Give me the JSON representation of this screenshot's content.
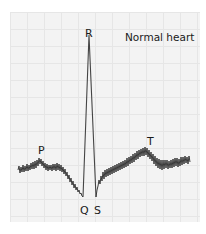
{
  "diagram": {
    "title": "Normal heart",
    "waves": {
      "P": "P",
      "Q": "Q",
      "R": "R",
      "S": "S",
      "T": "T"
    },
    "colors": {
      "background": "#ffffff",
      "grid_fill": "#f3f3f3",
      "grid_lines": "#e6e6e6",
      "trace": "#3a3a3a",
      "text": "#1a1a1a"
    },
    "trace_points": [
      [
        18,
        170
      ],
      [
        28,
        167
      ],
      [
        40,
        160
      ],
      [
        48,
        166
      ],
      [
        55,
        167
      ],
      [
        62,
        166
      ],
      [
        70,
        172
      ],
      [
        78,
        180
      ],
      [
        83,
        190
      ],
      [
        89,
        36
      ],
      [
        96,
        190
      ],
      [
        100,
        178
      ],
      [
        110,
        170
      ],
      [
        125,
        165
      ],
      [
        140,
        157
      ],
      [
        150,
        152
      ],
      [
        160,
        162
      ],
      [
        175,
        166
      ],
      [
        190,
        160
      ]
    ]
  }
}
